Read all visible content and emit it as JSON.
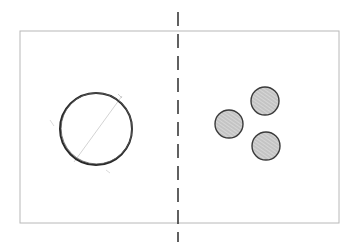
{
  "diagram": {
    "background": "#ffffff",
    "frame": {
      "x1": 20,
      "y1": 31,
      "x2": 339,
      "y2": 223,
      "stroke": "#b8b8b8"
    },
    "divider": {
      "x": 178,
      "y1": 12,
      "y2": 242,
      "stroke": "#3a3a3a",
      "style": "dashed"
    },
    "left_panel": {
      "large_circle": {
        "cx": 96,
        "cy": 129,
        "r": 36,
        "stroke": "#2a2a2a",
        "fill": "none"
      },
      "construction_line": {
        "x1": 74,
        "y1": 162,
        "x2": 122,
        "y2": 96,
        "stroke": "#c8c8c8"
      }
    },
    "right_panel": {
      "small_circles": [
        {
          "cx": 229,
          "cy": 124,
          "r": 14
        },
        {
          "cx": 265,
          "cy": 101,
          "r": 14
        },
        {
          "cx": 266,
          "cy": 146,
          "r": 14
        }
      ],
      "circle_fill": "#bdbdbd",
      "circle_stroke": "#3a3a3a"
    }
  }
}
